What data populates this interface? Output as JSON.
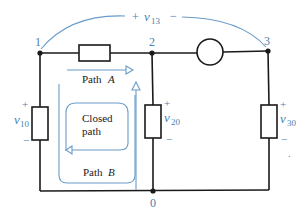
{
  "diagram": {
    "type": "circuit",
    "colors": {
      "wire": "#1a1a1a",
      "annotation": "#4a7fb0",
      "path": "#6a9cc8"
    },
    "nodes": [
      {
        "id": "1",
        "label": "1"
      },
      {
        "id": "2",
        "label": "2"
      },
      {
        "id": "3",
        "label": "3"
      },
      {
        "id": "0",
        "label": "0"
      }
    ],
    "voltages": {
      "v13": {
        "plus": "+",
        "symbol": "v",
        "sub": "13",
        "minus": "−"
      },
      "v10": {
        "plus": "+",
        "symbol": "v",
        "sub": "10",
        "minus": "−"
      },
      "v20": {
        "plus": "+",
        "symbol": "v",
        "sub": "20",
        "minus": "−"
      },
      "v30": {
        "plus": "+",
        "symbol": "v",
        "sub": "30",
        "minus": "−"
      }
    },
    "paths": {
      "path_a": {
        "word": "Path",
        "letter": "A"
      },
      "path_b": {
        "word": "Path",
        "letter": "B"
      },
      "closed": {
        "line1": "Closed",
        "line2": "path"
      }
    },
    "stray_mark": "."
  }
}
